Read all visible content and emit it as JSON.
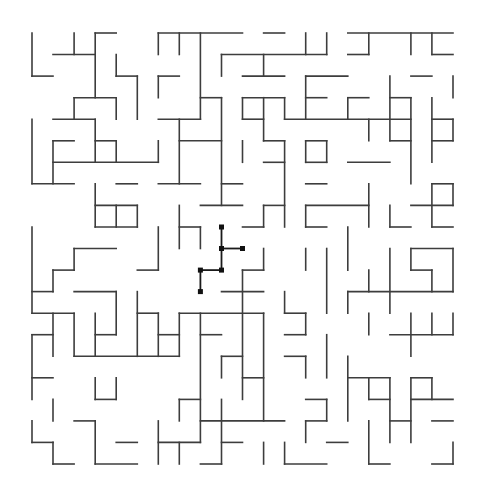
{
  "maze": {
    "title": "Maze",
    "cols": 20,
    "rows": 20,
    "origin": {
      "x": 32,
      "y": 33
    },
    "cell": {
      "w": 21.05,
      "h": 21.55
    },
    "colors": {
      "wall": "#3d3d3d",
      "path": "#1a1a1a",
      "background": "#ffffff"
    },
    "horizontal_walls": [
      [
        0,
        3,
        4
      ],
      [
        0,
        6,
        10
      ],
      [
        0,
        11,
        12
      ],
      [
        0,
        15,
        20
      ],
      [
        1,
        1,
        3
      ],
      [
        1,
        9,
        14
      ],
      [
        1,
        15,
        16
      ],
      [
        1,
        19,
        20
      ],
      [
        2,
        0,
        1
      ],
      [
        2,
        4,
        5
      ],
      [
        2,
        6,
        7
      ],
      [
        2,
        10,
        12
      ],
      [
        2,
        13,
        15
      ],
      [
        2,
        18,
        19
      ],
      [
        3,
        2,
        4
      ],
      [
        3,
        8,
        9
      ],
      [
        3,
        10,
        12
      ],
      [
        3,
        13,
        14
      ],
      [
        3,
        15,
        16
      ],
      [
        3,
        17,
        18
      ],
      [
        4,
        1,
        3
      ],
      [
        4,
        6,
        8
      ],
      [
        4,
        10,
        11
      ],
      [
        4,
        12,
        18
      ],
      [
        4,
        19,
        20
      ],
      [
        5,
        1,
        2
      ],
      [
        5,
        3,
        4
      ],
      [
        5,
        7,
        9
      ],
      [
        5,
        11,
        12
      ],
      [
        5,
        13,
        14
      ],
      [
        5,
        17,
        18
      ],
      [
        5,
        19,
        20
      ],
      [
        6,
        1,
        6
      ],
      [
        6,
        11,
        12
      ],
      [
        6,
        13,
        14
      ],
      [
        6,
        15,
        17
      ],
      [
        7,
        0,
        2
      ],
      [
        7,
        4,
        5
      ],
      [
        7,
        6,
        8
      ],
      [
        7,
        9,
        10
      ],
      [
        7,
        13,
        14
      ],
      [
        7,
        19,
        20
      ],
      [
        8,
        3,
        5
      ],
      [
        8,
        8,
        10
      ],
      [
        8,
        11,
        12
      ],
      [
        8,
        13,
        16
      ],
      [
        8,
        18,
        20
      ],
      [
        9,
        3,
        5
      ],
      [
        9,
        7,
        8
      ],
      [
        9,
        10,
        11
      ],
      [
        9,
        13,
        14
      ],
      [
        9,
        17,
        18
      ],
      [
        9,
        19,
        20
      ],
      [
        10,
        2,
        4
      ],
      [
        10,
        18,
        20
      ],
      [
        11,
        1,
        2
      ],
      [
        11,
        5,
        6
      ],
      [
        11,
        10,
        11
      ],
      [
        11,
        18,
        19
      ],
      [
        12,
        0,
        1
      ],
      [
        12,
        2,
        4
      ],
      [
        12,
        9,
        11
      ],
      [
        12,
        15,
        20
      ],
      [
        13,
        0,
        2
      ],
      [
        13,
        5,
        6
      ],
      [
        13,
        7,
        11
      ],
      [
        13,
        12,
        13
      ],
      [
        14,
        0,
        1
      ],
      [
        14,
        3,
        4
      ],
      [
        14,
        6,
        7
      ],
      [
        14,
        8,
        9
      ],
      [
        14,
        12,
        13
      ],
      [
        14,
        17,
        20
      ],
      [
        15,
        2,
        7
      ],
      [
        15,
        9,
        10
      ],
      [
        15,
        12,
        13
      ],
      [
        16,
        0,
        1
      ],
      [
        16,
        10,
        11
      ],
      [
        16,
        15,
        17
      ],
      [
        16,
        18,
        19
      ],
      [
        17,
        3,
        4
      ],
      [
        17,
        7,
        8
      ],
      [
        17,
        13,
        14
      ],
      [
        17,
        16,
        17
      ],
      [
        17,
        18,
        20
      ],
      [
        18,
        2,
        3
      ],
      [
        18,
        8,
        12
      ],
      [
        18,
        13,
        14
      ],
      [
        18,
        17,
        18
      ],
      [
        18,
        19,
        20
      ],
      [
        19,
        0,
        1
      ],
      [
        19,
        4,
        5
      ],
      [
        19,
        6,
        8
      ],
      [
        19,
        9,
        10
      ],
      [
        19,
        14,
        15
      ],
      [
        20,
        1,
        2
      ],
      [
        20,
        3,
        5
      ],
      [
        20,
        8,
        9
      ],
      [
        20,
        12,
        14
      ],
      [
        20,
        16,
        17
      ],
      [
        20,
        19,
        20
      ]
    ],
    "vertical_walls": [
      [
        0,
        0,
        2
      ],
      [
        0,
        4,
        7
      ],
      [
        0,
        9,
        13
      ],
      [
        0,
        14,
        17
      ],
      [
        0,
        18,
        19
      ],
      [
        1,
        5,
        7
      ],
      [
        1,
        11,
        12
      ],
      [
        1,
        13,
        15
      ],
      [
        1,
        17,
        18
      ],
      [
        1,
        19,
        20
      ],
      [
        2,
        0,
        1
      ],
      [
        2,
        3,
        4
      ],
      [
        2,
        10,
        11
      ],
      [
        2,
        13,
        15
      ],
      [
        3,
        0,
        3
      ],
      [
        3,
        4,
        6
      ],
      [
        3,
        7,
        9
      ],
      [
        3,
        13,
        15
      ],
      [
        3,
        16,
        17
      ],
      [
        3,
        18,
        20
      ],
      [
        4,
        1,
        2
      ],
      [
        4,
        3,
        4
      ],
      [
        4,
        5,
        6
      ],
      [
        4,
        8,
        9
      ],
      [
        4,
        12,
        14
      ],
      [
        4,
        16,
        17
      ],
      [
        5,
        2,
        4
      ],
      [
        5,
        8,
        9
      ],
      [
        5,
        12,
        15
      ],
      [
        6,
        0,
        1
      ],
      [
        6,
        2,
        3
      ],
      [
        6,
        5,
        6
      ],
      [
        6,
        9,
        11
      ],
      [
        6,
        13,
        15
      ],
      [
        6,
        18,
        20
      ],
      [
        7,
        0,
        1
      ],
      [
        7,
        4,
        7
      ],
      [
        7,
        8,
        10
      ],
      [
        7,
        13,
        15
      ],
      [
        7,
        17,
        18
      ],
      [
        7,
        19,
        20
      ],
      [
        8,
        0,
        4
      ],
      [
        8,
        9,
        10
      ],
      [
        8,
        13,
        19
      ],
      [
        9,
        1,
        2
      ],
      [
        9,
        3,
        8
      ],
      [
        9,
        15,
        16
      ],
      [
        9,
        17,
        20
      ],
      [
        10,
        3,
        4
      ],
      [
        10,
        5,
        6
      ],
      [
        10,
        11,
        17
      ],
      [
        11,
        1,
        2
      ],
      [
        11,
        3,
        5
      ],
      [
        11,
        8,
        9
      ],
      [
        11,
        10,
        11
      ],
      [
        11,
        13,
        18
      ],
      [
        11,
        19,
        20
      ],
      [
        12,
        3,
        4
      ],
      [
        12,
        5,
        9
      ],
      [
        12,
        12,
        13
      ],
      [
        12,
        19,
        20
      ],
      [
        13,
        0,
        1
      ],
      [
        13,
        2,
        4
      ],
      [
        13,
        5,
        6
      ],
      [
        13,
        8,
        9
      ],
      [
        13,
        10,
        11
      ],
      [
        13,
        13,
        14
      ],
      [
        13,
        15,
        16
      ],
      [
        13,
        18,
        19
      ],
      [
        14,
        0,
        1
      ],
      [
        14,
        5,
        6
      ],
      [
        14,
        10,
        13
      ],
      [
        14,
        14,
        16
      ],
      [
        14,
        17,
        18
      ],
      [
        15,
        3,
        4
      ],
      [
        15,
        9,
        11
      ],
      [
        15,
        12,
        13
      ],
      [
        15,
        15,
        18
      ],
      [
        16,
        0,
        1
      ],
      [
        16,
        4,
        5
      ],
      [
        16,
        7,
        9
      ],
      [
        16,
        11,
        12
      ],
      [
        16,
        13,
        14
      ],
      [
        16,
        16,
        17
      ],
      [
        16,
        18,
        20
      ],
      [
        17,
        2,
        5
      ],
      [
        17,
        8,
        9
      ],
      [
        17,
        10,
        13
      ],
      [
        17,
        16,
        19
      ],
      [
        18,
        0,
        1
      ],
      [
        18,
        3,
        7
      ],
      [
        18,
        10,
        11
      ],
      [
        18,
        13,
        15
      ],
      [
        18,
        16,
        19
      ],
      [
        19,
        0,
        1
      ],
      [
        19,
        3,
        6
      ],
      [
        19,
        7,
        9
      ],
      [
        19,
        11,
        12
      ],
      [
        19,
        13,
        14
      ],
      [
        19,
        16,
        17
      ],
      [
        20,
        2,
        3
      ],
      [
        20,
        4,
        5
      ],
      [
        20,
        7,
        8
      ],
      [
        20,
        10,
        12
      ],
      [
        20,
        13,
        14
      ],
      [
        20,
        19,
        20
      ]
    ],
    "solution_path": {
      "nodes": [
        [
          9,
          9
        ],
        [
          9,
          10
        ],
        [
          10,
          10
        ],
        [
          9,
          11
        ],
        [
          8,
          11
        ],
        [
          8,
          12
        ]
      ],
      "edges": [
        [
          [
            9,
            9
          ],
          [
            9,
            11
          ]
        ],
        [
          [
            9,
            10
          ],
          [
            10,
            10
          ]
        ],
        [
          [
            8,
            11
          ],
          [
            9,
            11
          ]
        ],
        [
          [
            8,
            11
          ],
          [
            8,
            12
          ]
        ]
      ]
    }
  }
}
